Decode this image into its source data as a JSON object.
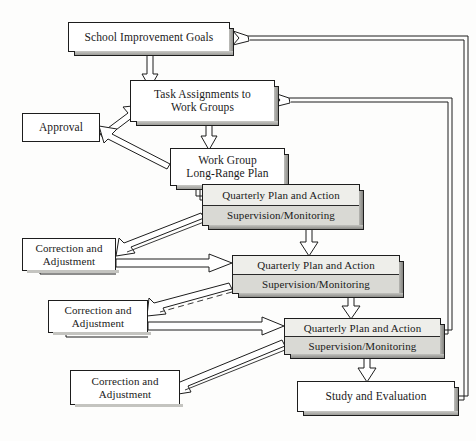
{
  "diagram": {
    "background_color": "#fdfdfc",
    "line_color": "#1d1d1d",
    "box_fill": "#ffffff",
    "band_fill_top": "#eeeeea",
    "band_fill_bottom": "#d9d9d4",
    "shadow_fill": "#9d9d99"
  },
  "nodes": {
    "goals": {
      "line1": "School Improvement Goals"
    },
    "task_assignments": {
      "line1": "Task Assignments to",
      "line2": "Work Groups"
    },
    "approval": {
      "line1": "Approval"
    },
    "long_range_plan": {
      "line1": "Work Group",
      "line2": "Long-Range Plan"
    },
    "quarterly_1": {
      "top": "Quarterly Plan and Action",
      "bottom": "Supervision/Monitoring"
    },
    "quarterly_2": {
      "top": "Quarterly Plan and Action",
      "bottom": "Supervision/Monitoring"
    },
    "quarterly_3": {
      "top": "Quarterly Plan and Action",
      "bottom": "Supervision/Monitoring"
    },
    "correction_1": {
      "line1": "Correction and",
      "line2": "Adjustment"
    },
    "correction_2": {
      "line1": "Correction and",
      "line2": "Adjustment"
    },
    "correction_3": {
      "line1": "Correction and",
      "line2": "Adjustment"
    },
    "study_evaluation": {
      "line1": "Study and Evaluation"
    }
  },
  "connectors": [
    {
      "name": "goals-to-task-assignments",
      "from": "goals",
      "to": "task_assignments",
      "style": "block-arrow-down"
    },
    {
      "name": "approval-to-task-assignments",
      "from": "approval",
      "to": "task_assignments",
      "style": "block-arrow-diagonal-up"
    },
    {
      "name": "task-assignments-to-approval",
      "from": "long_range_plan",
      "to": "approval",
      "style": "block-arrow-diagonal-left"
    },
    {
      "name": "task-assignments-to-long-range-plan",
      "from": "task_assignments",
      "to": "long_range_plan",
      "style": "block-arrow-down"
    },
    {
      "name": "long-range-plan-to-quarterly-1",
      "from": "long_range_plan",
      "to": "quarterly_1",
      "style": "line"
    },
    {
      "name": "quarterly-1-to-correction-1",
      "from": "quarterly_1",
      "to": "correction_1",
      "style": "block-arrow-diagonal-left"
    },
    {
      "name": "correction-1-to-quarterly-2",
      "from": "correction_1",
      "to": "quarterly_2",
      "style": "block-arrow-right"
    },
    {
      "name": "quarterly-1-to-quarterly-2",
      "from": "quarterly_1",
      "to": "quarterly_2",
      "style": "block-arrow-down"
    },
    {
      "name": "quarterly-2-to-correction-2",
      "from": "quarterly_2",
      "to": "correction_2",
      "style": "block-arrow-diagonal-left"
    },
    {
      "name": "correction-2-to-quarterly-3",
      "from": "correction_2",
      "to": "quarterly_3",
      "style": "block-arrow-right"
    },
    {
      "name": "quarterly-2-to-quarterly-3",
      "from": "quarterly_2",
      "to": "quarterly_3",
      "style": "block-arrow-down"
    },
    {
      "name": "quarterly-3-to-correction-3",
      "from": "quarterly_3",
      "to": "correction_3",
      "style": "block-arrow-diagonal-left"
    },
    {
      "name": "quarterly-3-to-study-evaluation",
      "from": "quarterly_3",
      "to": "study_evaluation",
      "style": "block-arrow-down"
    },
    {
      "name": "study-evaluation-to-goals",
      "from": "study_evaluation",
      "to": "goals",
      "style": "feedback-long-right"
    },
    {
      "name": "quarterly-3-to-task-assignments",
      "from": "quarterly_3",
      "to": "task_assignments",
      "style": "feedback-long-right"
    }
  ]
}
